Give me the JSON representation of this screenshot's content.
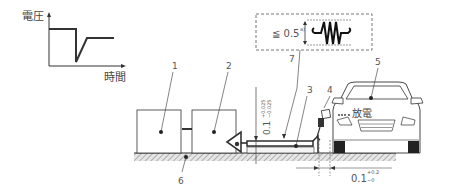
{
  "inset_graph": {
    "y_axis_label": "電圧",
    "x_axis_label": "時間",
    "description": "voltage drop transient vs time"
  },
  "detail_box": {
    "spark_gap_label": "≦ 0.5",
    "spark_gap_superscript": "a)"
  },
  "dimensions": {
    "vertical_gap": "0.1",
    "vertical_gap_tol_upper": "+0.025",
    "vertical_gap_tol_lower": "−0.025",
    "horizontal_gap": "0.1",
    "horizontal_gap_tol_upper": "+0.2",
    "horizontal_gap_tol_lower": "−0"
  },
  "callouts": {
    "c1": "1",
    "c2": "2",
    "c3": "3",
    "c4": "4",
    "c5": "5",
    "c6": "6",
    "c7": "7"
  },
  "car": {
    "label": "放電"
  },
  "colors": {
    "line": "#333333",
    "ground_hatch": "#888888",
    "dashed": "#777777"
  }
}
